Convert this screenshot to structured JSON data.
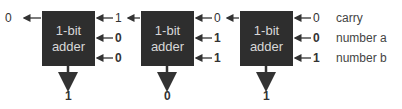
{
  "adders": [
    {
      "label_line1": "1-bit",
      "label_line2": "adder",
      "carry_in": "1",
      "a": "0",
      "b": "0",
      "carry_out": "0",
      "sum": "1"
    },
    {
      "label_line1": "1-bit",
      "label_line2": "adder",
      "carry_in": "0",
      "a": "1",
      "b": "1",
      "carry_out": "1",
      "sum": "0"
    },
    {
      "label_line1": "1-bit",
      "label_line2": "adder",
      "carry_in": "0",
      "a": "0",
      "b": "1",
      "carry_out": "0",
      "sum": "1"
    }
  ],
  "legend": {
    "carry": "carry",
    "a": "number a",
    "b": "number b"
  },
  "final_carry_out": "0"
}
